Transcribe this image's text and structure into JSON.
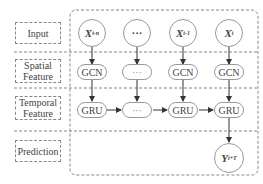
{
  "rows": {
    "input": "Input",
    "spatial": [
      "Spatial",
      "Feature"
    ],
    "temporal": [
      "Temporal",
      "Feature"
    ],
    "prediction": "Prediction"
  },
  "inputs": [
    {
      "base": "X",
      "sub": "t-n"
    },
    {
      "base": "···",
      "sub": ""
    },
    {
      "base": "X",
      "sub": "t-1"
    },
    {
      "base": "X",
      "sub": "t"
    }
  ],
  "spatial_nodes": [
    "GCN",
    "···",
    "GCN",
    "GCN"
  ],
  "temporal_nodes": [
    "GRU",
    "···",
    "GRU",
    "GRU"
  ],
  "output": {
    "base": "Y",
    "sub": "t+T"
  },
  "colors": {
    "stroke": "#999999",
    "dashed": "#888888",
    "text": "#444444"
  }
}
